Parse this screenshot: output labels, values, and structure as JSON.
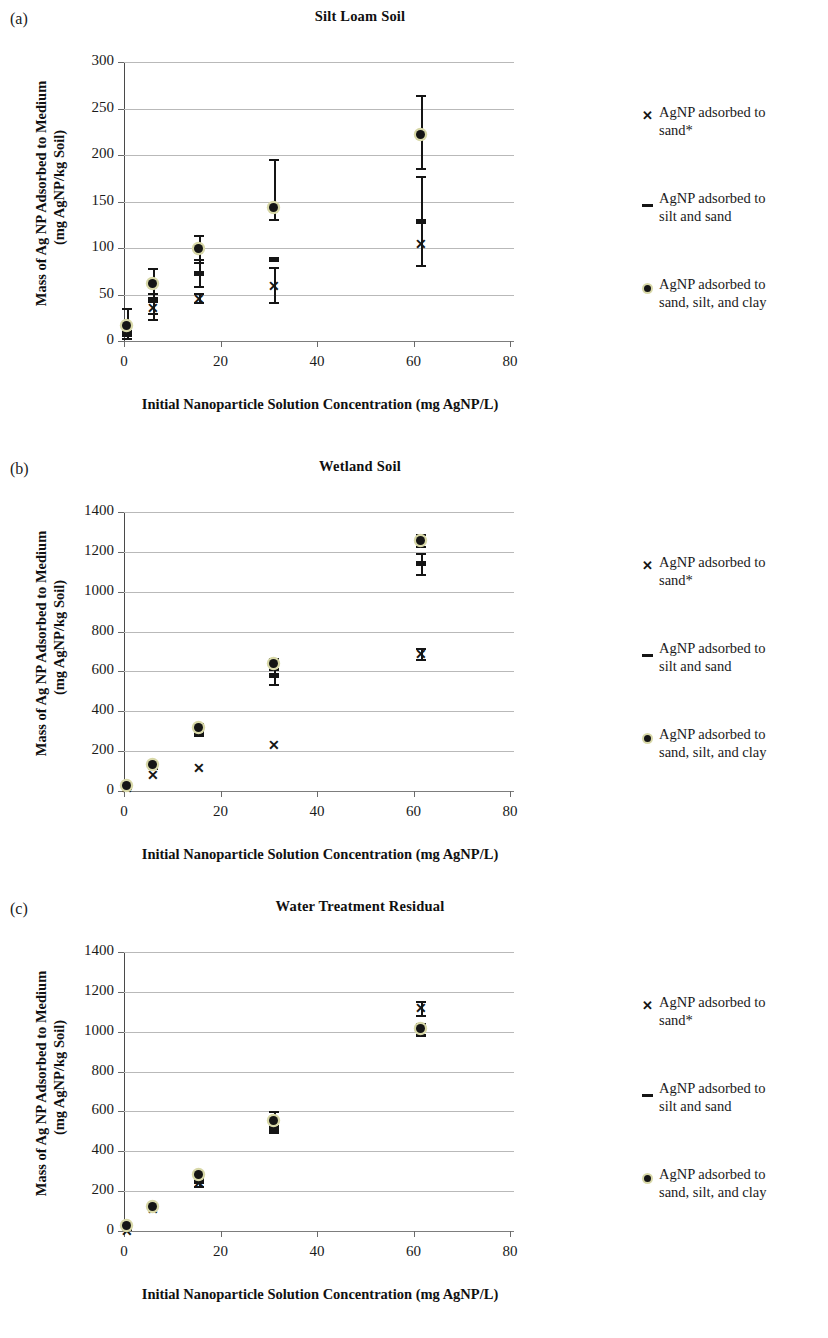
{
  "figure": {
    "shared_xlabel": "Initial Nanoparticle Solution Concentration (mg AgNP/L)",
    "shared_ylabel_line1": "Mass of Ag NP Adsorbed to Medium",
    "shared_ylabel_line2": "(mg AgNP/kg Soil)",
    "legend": [
      {
        "symbol": "x-marker",
        "label": "AgNP adsorbed to\nsand*"
      },
      {
        "symbol": "dash-marker",
        "label": "AgNP adsorbed to\nsilt and sand"
      },
      {
        "symbol": "dot-marker",
        "label": "AgNP adsorbed to\nsand, silt, and clay"
      }
    ],
    "panels": [
      {
        "letter": "(a)",
        "title": "Silt Loam Soil"
      },
      {
        "letter": "(b)",
        "title": "Wetland Soil"
      },
      {
        "letter": "(c)",
        "title": "Water Treatment Residual"
      }
    ]
  },
  "chart_data": [
    {
      "type": "scatter",
      "panel": "(a)",
      "title": "Silt Loam Soil",
      "xlabel": "Initial Nanoparticle Solution Concentration (mg AgNP/L)",
      "ylabel": "Mass of Ag NP Adsorbed to Medium (mg AgNP/kg Soil)",
      "xlim": [
        0,
        80
      ],
      "ylim": [
        0,
        300
      ],
      "xticks": [
        0,
        20,
        40,
        60,
        80
      ],
      "yticks": [
        0,
        50,
        100,
        150,
        200,
        250,
        300
      ],
      "grid": "horizontal",
      "legend_position": "right",
      "x": [
        0.6,
        6,
        15.5,
        31,
        61.5
      ],
      "series": [
        {
          "name": "AgNP adsorbed to sand*",
          "marker": "x",
          "values": [
            10,
            36,
            46,
            60,
            105
          ],
          "err_low": [
            null,
            24,
            42,
            null,
            null
          ],
          "err_high": [
            null,
            52,
            52,
            null,
            null
          ]
        },
        {
          "name": "AgNP adsorbed to silt and sand",
          "marker": "square",
          "values": [
            7,
            44,
            73,
            88,
            129
          ],
          "err_low": [
            3,
            30,
            59,
            42,
            82
          ],
          "err_high": [
            12,
            52,
            88,
            80,
            177
          ]
        },
        {
          "name": "AgNP adsorbed to sand, silt, and clay",
          "marker": "circle",
          "values": [
            17,
            62,
            99,
            144,
            222
          ],
          "err_low": [
            8,
            47,
            85,
            131,
            186
          ],
          "err_high": [
            36,
            79,
            114,
            196,
            265
          ]
        }
      ]
    },
    {
      "type": "scatter",
      "panel": "(b)",
      "title": "Wetland Soil",
      "xlabel": "Initial Nanoparticle Solution Concentration (mg AgNP/L)",
      "ylabel": "Mass of Ag NP Adsorbed to Medium (mg AgNP/kg Soil)",
      "xlim": [
        0,
        80
      ],
      "ylim": [
        0,
        1400
      ],
      "xticks": [
        0,
        20,
        40,
        60,
        80
      ],
      "yticks": [
        0,
        200,
        400,
        600,
        800,
        1000,
        1200,
        1400
      ],
      "grid": "horizontal",
      "legend_position": "right",
      "x": [
        0.6,
        6,
        15.5,
        31,
        61.5
      ],
      "series": [
        {
          "name": "AgNP adsorbed to sand*",
          "marker": "x",
          "values": [
            20,
            85,
            120,
            235,
            690
          ],
          "err_low": [
            null,
            null,
            null,
            null,
            660
          ],
          "err_high": [
            null,
            null,
            null,
            null,
            720
          ]
        },
        {
          "name": "AgNP adsorbed to silt and sand",
          "marker": "square",
          "values": [
            18,
            118,
            295,
            578,
            1143
          ],
          "err_low": [
            null,
            null,
            280,
            535,
            1090
          ],
          "err_high": [
            null,
            null,
            310,
            612,
            1195
          ]
        },
        {
          "name": "AgNP adsorbed to sand, silt, and clay",
          "marker": "circle",
          "values": [
            28,
            135,
            320,
            640,
            1258
          ],
          "err_low": [
            null,
            null,
            305,
            615,
            1228
          ],
          "err_high": [
            null,
            null,
            340,
            668,
            1290
          ]
        }
      ]
    },
    {
      "type": "scatter",
      "panel": "(c)",
      "title": "Water Treatment Residual",
      "xlabel": "Initial Nanoparticle Solution Concentration (mg AgNP/L)",
      "ylabel": "Mass of Ag NP Adsorbed to Medium (mg AgNP/kg Soil)",
      "xlim": [
        0,
        80
      ],
      "ylim": [
        0,
        1400
      ],
      "xticks": [
        0,
        20,
        40,
        60,
        80
      ],
      "yticks": [
        0,
        200,
        400,
        600,
        800,
        1000,
        1200,
        1400
      ],
      "grid": "horizontal",
      "legend_position": "right",
      "x": [
        0.6,
        6,
        15.5,
        31,
        61.5
      ],
      "series": [
        {
          "name": "AgNP adsorbed to sand*",
          "marker": "x",
          "values": [
            5,
            115,
            245,
            528,
            1120
          ],
          "err_low": [
            null,
            null,
            225,
            505,
            1085
          ],
          "err_high": [
            null,
            null,
            262,
            552,
            1155
          ]
        },
        {
          "name": "AgNP adsorbed to silt and sand",
          "marker": "square",
          "values": [
            12,
            118,
            248,
            520,
            1012
          ],
          "err_low": [
            null,
            null,
            228,
            498,
            985
          ],
          "err_high": [
            null,
            null,
            268,
            548,
            1040
          ]
        },
        {
          "name": "AgNP adsorbed to sand, silt, and clay",
          "marker": "circle",
          "values": [
            30,
            122,
            285,
            555,
            1015
          ],
          "err_low": [
            null,
            null,
            268,
            520,
            988
          ],
          "err_high": [
            null,
            null,
            300,
            600,
            1045
          ]
        }
      ]
    }
  ]
}
